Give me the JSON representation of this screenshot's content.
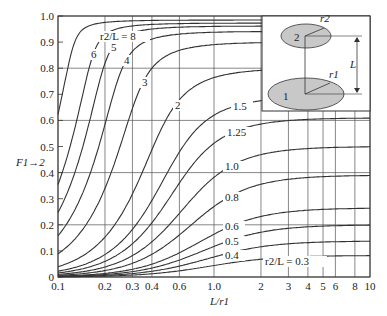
{
  "chart_data": {
    "type": "line",
    "title": "",
    "xlabel": "L/r1",
    "ylabel": "F1→2",
    "xscale": "log",
    "xlim": [
      0.1,
      10
    ],
    "ylim": [
      0,
      1.0
    ],
    "grid": true,
    "x_ticks": [
      "0.1",
      "0.2",
      "0.3",
      "0.4",
      "0.6",
      "1.0",
      "2",
      "3",
      "4",
      "5",
      "6",
      "8",
      "10"
    ],
    "x_tick_values": [
      0.1,
      0.2,
      0.3,
      0.4,
      0.6,
      1.0,
      2,
      3,
      4,
      5,
      6,
      8,
      10
    ],
    "y_ticks": [
      "0",
      "0.1",
      "0.2",
      "0.3",
      "0.4",
      "0.5",
      "0.6",
      "0.7",
      "0.8",
      "0.9",
      "1.0"
    ],
    "y_tick_values": [
      0,
      0.1,
      0.2,
      0.3,
      0.4,
      0.5,
      0.6,
      0.7,
      0.8,
      0.9,
      1.0
    ],
    "series_param": "r2/L",
    "series": [
      {
        "name": "8",
        "label": "r2/L = 8",
        "r2_over_L": 8,
        "label_pos": [
          100,
          40
        ]
      },
      {
        "name": "6",
        "label": "6",
        "r2_over_L": 6,
        "label_pos": [
          91,
          58
        ]
      },
      {
        "name": "5",
        "label": "5",
        "r2_over_L": 5,
        "label_pos": [
          111,
          51
        ]
      },
      {
        "name": "4",
        "label": "4",
        "r2_over_L": 4,
        "label_pos": [
          124,
          64
        ]
      },
      {
        "name": "3",
        "label": "3",
        "r2_over_L": 3,
        "label_pos": [
          142,
          86
        ]
      },
      {
        "name": "2",
        "label": "2",
        "r2_over_L": 2,
        "label_pos": [
          175,
          109
        ]
      },
      {
        "name": "1.5",
        "label": "1.5",
        "r2_over_L": 1.5,
        "label_pos": [
          233,
          110
        ]
      },
      {
        "name": "1.25",
        "label": "1.25",
        "r2_over_L": 1.25,
        "label_pos": [
          227,
          136
        ]
      },
      {
        "name": "1.0",
        "label": "1.0",
        "r2_over_L": 1.0,
        "label_pos": [
          225,
          170
        ]
      },
      {
        "name": "0.8",
        "label": "0.8",
        "r2_over_L": 0.8,
        "label_pos": [
          225,
          201
        ]
      },
      {
        "name": "0.6",
        "label": "0.6",
        "r2_over_L": 0.6,
        "label_pos": [
          225,
          230
        ]
      },
      {
        "name": "0.5",
        "label": "0.5",
        "r2_over_L": 0.5,
        "label_pos": [
          225,
          245
        ]
      },
      {
        "name": "0.4",
        "label": "0.4",
        "r2_over_L": 0.4,
        "label_pos": [
          225,
          259
        ]
      },
      {
        "name": "0.3",
        "label": "r2/L = 0.3",
        "r2_over_L": 0.3,
        "label_pos": [
          265,
          265
        ]
      }
    ],
    "sample_values": {
      "note": "F at L/r1 = 0.1, 1.0, 10",
      "r2/L=8": [
        0.64,
        0.985,
        0.99
      ],
      "r2/L=3": [
        0.0,
        0.9,
        0.9
      ],
      "r2/L=1.0": [
        0.0,
        0.38,
        0.5
      ],
      "r2/L=0.3": [
        0.0,
        0.04,
        0.08
      ]
    },
    "inset": {
      "disk_labels": [
        "1",
        "2"
      ],
      "radius_labels": [
        "r1",
        "r2"
      ],
      "distance_label": "L"
    }
  }
}
